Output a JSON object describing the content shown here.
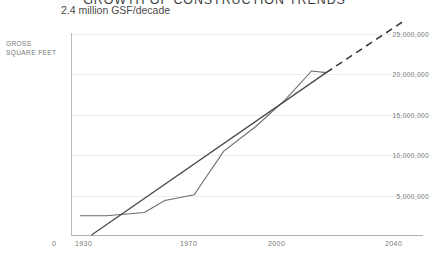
{
  "header": {
    "title": "GROWTH OF CONSTRUCTION TRENDS",
    "subtitle": "2.4 million GSF/decade"
  },
  "axis": {
    "y_unit_line1": "GROSS",
    "y_unit_line2": "SQUARE FEET"
  },
  "chart_data": {
    "type": "line",
    "title": "GROWTH OF CONSTRUCTION TRENDS",
    "subtitle": "2.4 million GSF/decade",
    "xlabel": "",
    "ylabel": "GROSS SQUARE FEET",
    "xlim": [
      1920,
      2040
    ],
    "ylim": [
      0,
      25000000
    ],
    "grid": true,
    "legend": "none",
    "yticks": [
      5000000,
      10000000,
      15000000,
      20000000,
      25000000
    ],
    "ytick_labels": [
      "5,000,000",
      "10,000,000",
      "15,000,000",
      "20,000,000",
      "25,000,000"
    ],
    "xticks": [
      1930,
      1970,
      2000,
      2040
    ],
    "xtick_labels": [
      "1930",
      "1970",
      "2000",
      "2040"
    ],
    "x_origin_label": "0",
    "series": [
      {
        "name": "Cumulative gross square feet",
        "style": "solid",
        "color": "#6e6e6e",
        "x": [
          1923,
          1932,
          1945,
          1952,
          1962,
          1972,
          1983,
          1993,
          2002,
          2007
        ],
        "values": [
          2400000,
          2400000,
          2800000,
          4300000,
          5000000,
          10400000,
          13500000,
          16800000,
          20400000,
          20200000
        ]
      },
      {
        "name": "Trend line (2.4 million GSF/decade)",
        "style": "solid",
        "color": "#4a4a4a",
        "x": [
          1927,
          2007
        ],
        "values": [
          0,
          20200000
        ]
      },
      {
        "name": "Projected trend",
        "style": "dashed",
        "color": "#3a3a3a",
        "x": [
          2007,
          2033
        ],
        "values": [
          20200000,
          26500000
        ]
      }
    ]
  }
}
